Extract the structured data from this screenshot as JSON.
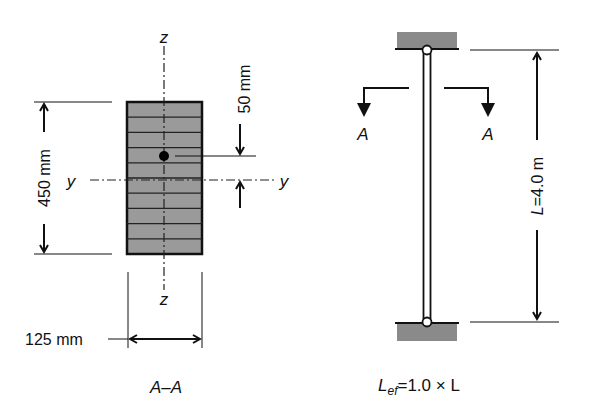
{
  "section": {
    "axis_z_top": "z",
    "axis_z_bottom": "z",
    "axis_y_left": "y",
    "axis_y_right": "y",
    "height_dim": "450 mm",
    "width_dim": "125 mm",
    "offset_dim": "50 mm",
    "laminations": 10,
    "caption": "A–A"
  },
  "column": {
    "section_mark_left": "A",
    "section_mark_right": "A",
    "length_dim": "L=4.0 m",
    "caption_L": "L",
    "caption_sub": "ef",
    "caption_rest": "=1.0 × L"
  },
  "colors": {
    "fill_gray": "#9a9a9a",
    "line": "#111111"
  }
}
